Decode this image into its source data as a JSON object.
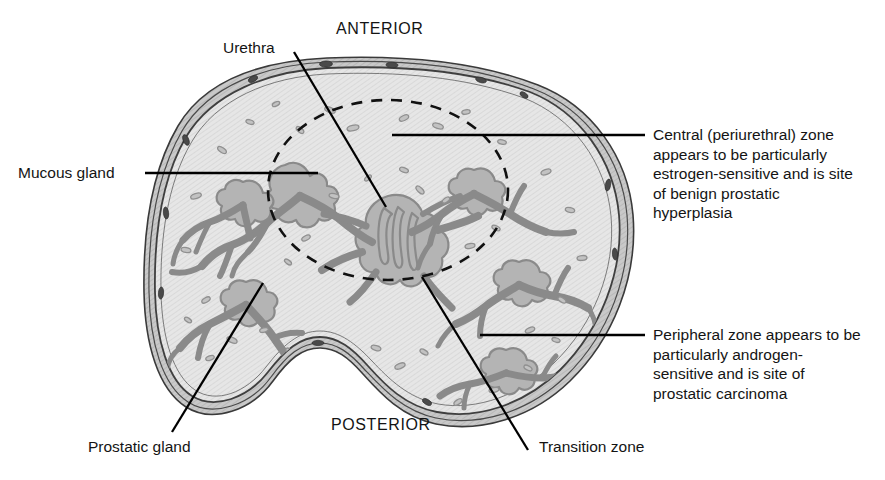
{
  "orientation": {
    "anterior": "ANTERIOR",
    "posterior": "POSTERIOR"
  },
  "labels": {
    "urethra": "Urethra",
    "mucous_gland": "Mucous gland",
    "prostatic_gland": "Prostatic gland",
    "transition_zone": "Transition zone",
    "central_zone": "Central (periurethral) zone appears to be particularly estrogen-sensitive and is site of benign prostatic hyperplasia",
    "peripheral_zone": "Peripheral zone appears to be particularly androgen-sensitive and is site of prostatic carcinoma"
  },
  "colors": {
    "stroma": "#e3e3e3",
    "gland": "#b4b4b4",
    "gland_outline": "#8a8a8a",
    "capsule": "#3a3a3a",
    "capsule_fill": "#c9c9c9",
    "leader": "#000000",
    "text": "#141414",
    "background": "#ffffff"
  }
}
